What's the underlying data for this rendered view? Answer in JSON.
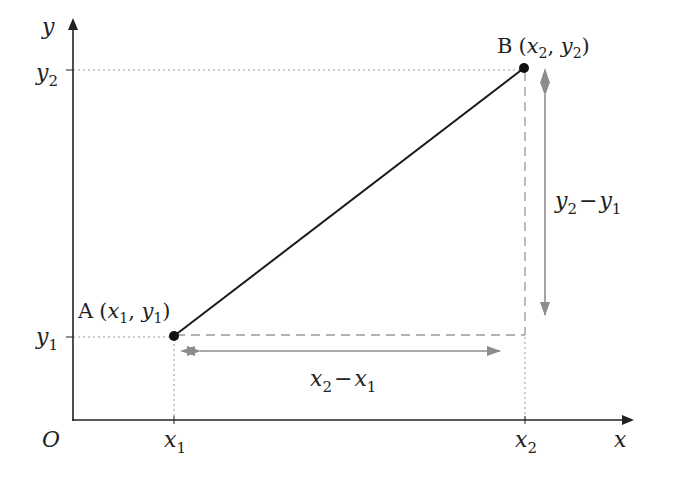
{
  "diagram": {
    "type": "distance-between-two-points",
    "colors": {
      "axis": "#222222",
      "segment": "#1a1a1a",
      "guide": "#999999",
      "arrow": "#8c8c8c",
      "text": "#222222"
    },
    "axes": {
      "x_label": "x",
      "y_label": "y",
      "origin_label": "O"
    },
    "ticks": {
      "x1": {
        "base": "x",
        "sub": "1"
      },
      "x2": {
        "base": "x",
        "sub": "2"
      },
      "y1": {
        "base": "y",
        "sub": "1"
      },
      "y2": {
        "base": "y",
        "sub": "2"
      }
    },
    "points": {
      "A": {
        "name": "A",
        "coord_open": "(",
        "x_base": "x",
        "x_sub": "1",
        "sep": ", ",
        "y_base": "y",
        "y_sub": "1",
        "coord_close": ")"
      },
      "B": {
        "name": "B",
        "coord_open": "(",
        "x_base": "x",
        "x_sub": "2",
        "sep": ", ",
        "y_base": "y",
        "y_sub": "2",
        "coord_close": ")"
      }
    },
    "dimensions": {
      "horizontal": {
        "a_base": "x",
        "a_sub": "2",
        "minus": "−",
        "b_base": "x",
        "b_sub": "1"
      },
      "vertical": {
        "a_base": "y",
        "a_sub": "2",
        "minus": "−",
        "b_base": "y",
        "b_sub": "1"
      }
    }
  }
}
